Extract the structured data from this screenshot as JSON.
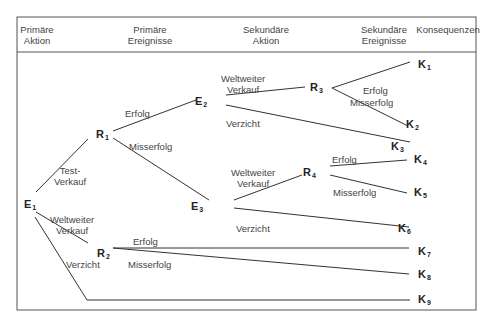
{
  "headers": [
    {
      "id": "primary-action",
      "line1": "Primäre",
      "line2": "Aktion",
      "x": 37
    },
    {
      "id": "primary-events",
      "line1": "Primäre",
      "line2": "Ereignisse",
      "x": 150
    },
    {
      "id": "secondary-action",
      "line1": "Sekundäre",
      "line2": "Aktion",
      "x": 266
    },
    {
      "id": "secondary-events",
      "line1": "Sekundäre",
      "line2": "Ereignisse",
      "x": 384
    },
    {
      "id": "consequences",
      "line1": "Konsequenzen",
      "line2": "",
      "x": 448
    }
  ],
  "nodes": {
    "E1": {
      "base": "E",
      "sub": "1"
    },
    "E2": {
      "base": "E",
      "sub": "2"
    },
    "E3": {
      "base": "E",
      "sub": "3"
    },
    "R1": {
      "base": "R",
      "sub": "1"
    },
    "R2": {
      "base": "R",
      "sub": "2"
    },
    "R3": {
      "base": "R",
      "sub": "3"
    },
    "R4": {
      "base": "R",
      "sub": "4"
    },
    "K1": {
      "base": "K",
      "sub": "1"
    },
    "K2": {
      "base": "K",
      "sub": "2"
    },
    "K3": {
      "base": "K",
      "sub": "3"
    },
    "K4": {
      "base": "K",
      "sub": "4"
    },
    "K5": {
      "base": "K",
      "sub": "5"
    },
    "K6": {
      "base": "K",
      "sub": "6"
    },
    "K7": {
      "base": "K",
      "sub": "7"
    },
    "K8": {
      "base": "K",
      "sub": "8"
    },
    "K9": {
      "base": "K",
      "sub": "9"
    }
  },
  "edge_labels": {
    "test_sale_1": "Test-",
    "test_sale_2": "Verkauf",
    "ww_sale_e1_1": "Weltweiter",
    "ww_sale_e1_2": "Verkauf",
    "waive_e1": "Verzicht",
    "success_r1": "Erfolg",
    "failure_r1": "Misserfolg",
    "success_r2": "Erfolg",
    "failure_r2": "Misserfolg",
    "ww_sale_e2_1": "Weltweiter",
    "ww_sale_e2_2": "Verkauf",
    "waive_e2": "Verzicht",
    "ww_sale_e3_1": "Weltweiter",
    "ww_sale_e3_2": "Verkauf",
    "waive_e3": "Verzicht",
    "success_r3": "Erfolg",
    "failure_r3": "Misserfolg",
    "success_r4": "Erfolg",
    "failure_r4": "Misserfolg"
  },
  "colors": {
    "line": "#333333",
    "frame": "#555555",
    "text": "#444444"
  }
}
